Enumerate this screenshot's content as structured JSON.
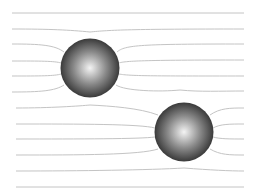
{
  "diagram": {
    "background": "#ffffff",
    "line_color": "#c4c4c4",
    "sphere_colors": {
      "highlight": "#f4f4f4",
      "mid": "#8a8a8a",
      "edge": "#3a3a3a"
    },
    "spheres": [
      {
        "id": "sphere-1",
        "cx": 90,
        "cy": 68,
        "r": 29.5
      },
      {
        "id": "sphere-2",
        "cx": 184,
        "cy": 132,
        "r": 29.5
      }
    ],
    "lines": [
      {
        "d": "M12,13 L244,13"
      },
      {
        "d": "M12,29 C50,29 70,30 90,32 C110,30 130,29 244,29"
      },
      {
        "d": "M12,44 C40,44 55,45 64,52 M117,52 C125,45 140,44 244,44"
      },
      {
        "d": "M12,61 C40,61 55,61 61,63 M119,63 C125,61 140,60 244,60"
      },
      {
        "d": "M12,76 C40,76 55,76 61,74 M119,74 C130,76 150,76 244,76"
      },
      {
        "d": "M12,92 C40,92 55,91 64,85 M116,85 C125,91 160,92 180,90 C200,92 220,91 244,91"
      },
      {
        "d": "M16,108 C50,108 80,106 90,105 C110,106 140,108 158,115 M210,115 C220,108 230,108 244,108"
      },
      {
        "d": "M16,124 C80,124 140,124 155,128 M213,128 C220,124 230,124 244,124"
      },
      {
        "d": "M16,139 C80,139 140,139 155,137 M213,137 C220,139 230,139 244,139"
      },
      {
        "d": "M16,155 C80,155 140,155 158,149 M210,149 C220,155 230,155 244,155"
      },
      {
        "d": "M16,171 C80,171 150,170 184,168 C210,170 230,171 244,171"
      },
      {
        "d": "M16,187 L244,187"
      }
    ]
  }
}
